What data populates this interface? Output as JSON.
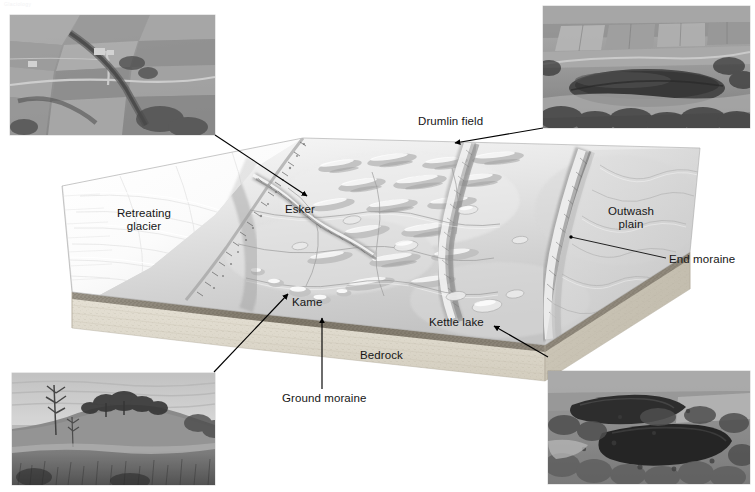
{
  "figure": {
    "ghost_caption": "Glaciology",
    "width": 755,
    "height": 492,
    "background": "#ffffff"
  },
  "colors": {
    "ink": "#161616",
    "leader": "#000000",
    "bedrock_face": "#ded8cb",
    "bedrock_top": "#cfc9bb",
    "ground_moraine": "#8c8578",
    "terrain_light": "#f2f2f2",
    "terrain_mid": "#c8c8c8",
    "terrain_dark": "#8a8a8a",
    "glacier": "#fbfbfb",
    "photo_frame": "#cfcfcf"
  },
  "labels": [
    {
      "id": "drumlin-field",
      "text": "Drumlin field",
      "x": 418,
      "y": 115,
      "align": "left",
      "describes": "Swarm of streamlined ice-moulded hills beneath the former ice sheet"
    },
    {
      "id": "retreating-glacier",
      "text": "Retreating\nglacier",
      "x": 143,
      "y": 207,
      "align": "center",
      "describes": "Ice margin wasting back toward the upper left of the block"
    },
    {
      "id": "esker",
      "text": "Esker",
      "x": 285,
      "y": 203,
      "align": "left",
      "describes": "Sinuous ridge of sand and gravel deposited by a subglacial stream"
    },
    {
      "id": "outwash-plain",
      "text": "Outwash\nplain",
      "x": 630,
      "y": 205,
      "align": "center",
      "describes": "Braided meltwater sediment apron beyond the end moraine"
    },
    {
      "id": "end-moraine",
      "text": "End moraine",
      "x": 669,
      "y": 260,
      "align": "left",
      "describes": "Arcuate ridge marking a former still-stand of the ice front"
    },
    {
      "id": "kame",
      "text": "Kame",
      "x": 292,
      "y": 296,
      "align": "left",
      "describes": "Isolated mound of stratified drift let down as the ice melted"
    },
    {
      "id": "kettle-lake",
      "text": "Kettle lake",
      "x": 429,
      "y": 321,
      "align": "left",
      "describes": "Water-filled depression where a buried ice block melted out"
    },
    {
      "id": "bedrock",
      "text": "Bedrock",
      "x": 360,
      "y": 353,
      "align": "left",
      "describes": "Solid rock substrate shown on the cut face of the block"
    },
    {
      "id": "ground-moraine",
      "text": "Ground moraine",
      "x": 282,
      "y": 396,
      "align": "left",
      "describes": "Sheet of till plastered beneath the ice, capping the bedrock"
    }
  ],
  "photos": [
    {
      "id": "esker-photo",
      "position": "top-left",
      "x": 10,
      "y": 15,
      "width": 205,
      "height": 120,
      "subject": "Aerial view of farmland crossed by a sinuous esker ridge",
      "points_to": "esker"
    },
    {
      "id": "drumlin-photo",
      "position": "top-right",
      "x": 543,
      "y": 6,
      "width": 207,
      "height": 122,
      "subject": "Aerial view of an elongated drumlin in cultivated fields",
      "points_to": "drumlin-field"
    },
    {
      "id": "kame-photo",
      "position": "bottom-left",
      "x": 12,
      "y": 373,
      "width": 203,
      "height": 112,
      "subject": "Ground view of a grassy kame mound topped with trees",
      "points_to": "kame"
    },
    {
      "id": "kettle-photo",
      "position": "bottom-right",
      "x": 548,
      "y": 371,
      "width": 202,
      "height": 113,
      "subject": "Aerial view of two dark kettle lakes ringed by forest",
      "points_to": "kettle-lake"
    }
  ],
  "leaders": [
    {
      "id": "leader-esker",
      "from_photo": "esker-photo",
      "to_label": "esker",
      "x1": 215,
      "y1": 135,
      "x2": 307,
      "y2": 196,
      "arrow_at": "end"
    },
    {
      "id": "leader-drumlin",
      "from_photo": "drumlin-photo",
      "to_label": "drumlin-field",
      "x1": 543,
      "y1": 128,
      "x2": 455,
      "y2": 143,
      "arrow_at": "end"
    },
    {
      "id": "leader-kame",
      "from_photo": "kame-photo",
      "to_label": "kame",
      "x1": 214,
      "y1": 372,
      "x2": 288,
      "y2": 294,
      "arrow_at": "end"
    },
    {
      "id": "leader-kettle",
      "from_photo": "kettle-photo",
      "to_label": "kettle-lake",
      "x1": 548,
      "y1": 357,
      "x2": 494,
      "y2": 326,
      "arrow_at": "end"
    },
    {
      "id": "leader-end-moraine",
      "from_label": "end-moraine",
      "to_point": "moraine ridge crest",
      "x1": 666,
      "y1": 258,
      "x2": 571,
      "y2": 237,
      "arrow_at": "none"
    },
    {
      "id": "leader-ground-moraine",
      "from_label": "ground-moraine",
      "to_point": "till layer on block face",
      "x1": 322,
      "y1": 389,
      "x2": 322,
      "y2": 318,
      "arrow_at": "end"
    }
  ],
  "block": {
    "top_surface": "Shaded-relief glacial terrain, grayscale",
    "front_face": "Speckled bedrock with dark ground-moraine cap",
    "features": [
      "retreating glacier tongue",
      "drumlin field",
      "esker ridge",
      "kame mounds",
      "end moraine arc",
      "kettle lakes",
      "outwash plain",
      "meltwater stream channels"
    ]
  }
}
